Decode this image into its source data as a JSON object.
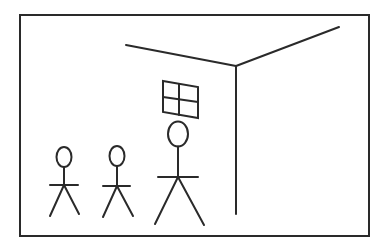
{
  "figure": {
    "colors": {
      "background": "#ffffff",
      "stroke": "#2a2a2a"
    },
    "frame": {
      "x": 20,
      "y": 15,
      "width": 349,
      "height": 221,
      "stroke_width": 2
    },
    "room_corner": {
      "left_ceiling_line": {
        "x1": 126,
        "y1": 45,
        "x2": 236,
        "y2": 66
      },
      "right_ceiling_line": {
        "x1": 236,
        "y1": 66,
        "x2": 339,
        "y2": 27
      },
      "vertical_edge": {
        "x1": 236,
        "y1": 66,
        "x2": 236,
        "y2": 214
      }
    },
    "window": {
      "points": "163,81 198,87 198,118 163,112",
      "vertical_divider": {
        "x1": 179,
        "y1": 84,
        "x2": 179,
        "y2": 115
      },
      "horizontal_divider": {
        "x1": 163,
        "y1": 97,
        "x2": 198,
        "y2": 102
      }
    },
    "stick_figures": [
      {
        "name": "small-figure-left",
        "head": {
          "cx": 64,
          "cy": 157,
          "rx": 7.5,
          "ry": 10
        },
        "body": {
          "x1": 64,
          "y1": 167,
          "x2": 64,
          "y2": 185
        },
        "arms": {
          "x1": 50,
          "y1": 185,
          "x2": 78,
          "y2": 185
        },
        "left_leg": {
          "x1": 64,
          "y1": 185,
          "x2": 50,
          "y2": 216
        },
        "right_leg": {
          "x1": 64,
          "y1": 185,
          "x2": 79,
          "y2": 214
        }
      },
      {
        "name": "small-figure-middle",
        "head": {
          "cx": 117,
          "cy": 156,
          "rx": 7.5,
          "ry": 10
        },
        "body": {
          "x1": 117,
          "y1": 166,
          "x2": 117,
          "y2": 186
        },
        "arms": {
          "x1": 103,
          "y1": 186,
          "x2": 130,
          "y2": 186
        },
        "left_leg": {
          "x1": 117,
          "y1": 186,
          "x2": 103,
          "y2": 217
        },
        "right_leg": {
          "x1": 117,
          "y1": 186,
          "x2": 133,
          "y2": 216
        }
      },
      {
        "name": "large-figure",
        "head": {
          "cx": 178,
          "cy": 134,
          "rx": 10,
          "ry": 12.5
        },
        "body": {
          "x1": 178,
          "y1": 146.5,
          "x2": 178,
          "y2": 177
        },
        "arms": {
          "x1": 158,
          "y1": 177,
          "x2": 198,
          "y2": 177
        },
        "left_leg": {
          "x1": 178,
          "y1": 177,
          "x2": 155,
          "y2": 224
        },
        "right_leg": {
          "x1": 178,
          "y1": 177,
          "x2": 204,
          "y2": 225
        }
      }
    ]
  }
}
